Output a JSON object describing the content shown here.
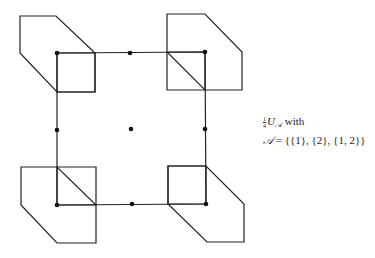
{
  "diagram": {
    "stroke_color": "#222222",
    "dot_color": "#111111",
    "main_square": {
      "points": [
        [
          57,
          53
        ],
        [
          205,
          52
        ],
        [
          206,
          204
        ],
        [
          57,
          205
        ]
      ]
    },
    "inner_squares": [
      {
        "points": [
          [
            57,
            53
          ],
          [
            95,
            53
          ],
          [
            95,
            92
          ],
          [
            57,
            92
          ]
        ]
      },
      {
        "points": [
          [
            167,
            52
          ],
          [
            205,
            52
          ],
          [
            205,
            90
          ],
          [
            167,
            90
          ]
        ]
      },
      {
        "points": [
          [
            57,
            167
          ],
          [
            96,
            167
          ],
          [
            96,
            205
          ],
          [
            57,
            205
          ]
        ]
      },
      {
        "points": [
          [
            168,
            166
          ],
          [
            206,
            166
          ],
          [
            206,
            204
          ],
          [
            168,
            204
          ]
        ]
      }
    ],
    "hexagons": [
      {
        "name": "top-left",
        "points": [
          [
            20,
            16
          ],
          [
            56,
            16
          ],
          [
            95,
            53
          ],
          [
            95,
            92
          ],
          [
            57,
            92
          ],
          [
            20,
            53
          ]
        ]
      },
      {
        "name": "top-right",
        "points": [
          [
            167,
            14
          ],
          [
            205,
            14
          ],
          [
            242,
            52
          ],
          [
            242,
            90
          ],
          [
            205,
            90
          ],
          [
            167,
            52
          ]
        ]
      },
      {
        "name": "bottom-left",
        "points": [
          [
            21,
            167
          ],
          [
            57,
            167
          ],
          [
            96,
            205
          ],
          [
            96,
            243
          ],
          [
            57,
            243
          ],
          [
            21,
            205
          ]
        ]
      },
      {
        "name": "bottom-right",
        "points": [
          [
            168,
            166
          ],
          [
            206,
            166
          ],
          [
            244,
            204
          ],
          [
            244,
            242
          ],
          [
            207,
            242
          ],
          [
            168,
            204
          ]
        ]
      }
    ],
    "dots": [
      [
        57,
        53
      ],
      [
        130,
        53
      ],
      [
        205,
        52
      ],
      [
        57,
        130
      ],
      [
        131,
        129
      ],
      [
        205,
        129
      ],
      [
        57,
        205
      ],
      [
        132,
        204
      ],
      [
        206,
        204
      ]
    ]
  },
  "caption": {
    "fraction_num": "1",
    "fraction_den": "4",
    "symbol": "U",
    "subscript": "𝒜",
    "line1_suffix": " with",
    "line2_lhs": "𝒜",
    "line2_rhs": " = {{1}, {2}, {1, 2}}"
  }
}
